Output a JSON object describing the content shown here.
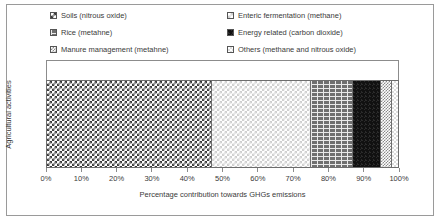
{
  "chart_data": {
    "type": "bar",
    "orientation": "horizontal",
    "stacked": true,
    "title": "",
    "xlabel": "Percentage contribution towards GHGs emissions",
    "ylabel": "Agricultural activities",
    "categories": [
      "Agricultural activities"
    ],
    "xlim": [
      0,
      100
    ],
    "grid": false,
    "legend_position": "top",
    "x_tick_labels": [
      "0%",
      "10%",
      "20%",
      "30%",
      "40%",
      "50%",
      "60%",
      "70%",
      "80%",
      "90%",
      "100%"
    ],
    "x_tick_values": [
      0,
      10,
      20,
      30,
      40,
      50,
      60,
      70,
      80,
      90,
      100
    ],
    "series": [
      {
        "name": "Soils (nitrous oxide)",
        "values": [
          47
        ],
        "pattern": "checker-dark",
        "color": "#3c3c3c"
      },
      {
        "name": "Enteric fermentation (methane)",
        "values": [
          28
        ],
        "pattern": "dots-light",
        "color": "#cfcfcf"
      },
      {
        "name": "Rice (metahne)",
        "values": [
          12
        ],
        "pattern": "brick-mid",
        "color": "#6f6f6f"
      },
      {
        "name": "Energy related (carbon dioxide)",
        "values": [
          8
        ],
        "pattern": "solid-black",
        "color": "#111111"
      },
      {
        "name": "Manure management (metahne)",
        "values": [
          3
        ],
        "pattern": "dots-mid",
        "color": "#8a8a8a"
      },
      {
        "name": "Others (methane and nitrous oxide)",
        "values": [
          2
        ],
        "pattern": "dots-vlight",
        "color": "#dddddd"
      }
    ]
  },
  "legend": {
    "left_column": [
      {
        "label": "Soils (nitrous oxide)"
      },
      {
        "label": "Rice (metahne)"
      },
      {
        "label": "Manure management (metahne)"
      }
    ],
    "right_column": [
      {
        "label": "Enteric fermentation (methane)"
      },
      {
        "label": "Energy related (carbon dioxide)"
      },
      {
        "label": "Others (methane and nitrous oxide)"
      }
    ]
  },
  "axes": {
    "x_title": "Percentage contribution towards GHGs emissions",
    "y_title": "Agricultural activities",
    "x_labels": [
      "0%",
      "10%",
      "20%",
      "30%",
      "40%",
      "50%",
      "60%",
      "70%",
      "80%",
      "90%",
      "100%"
    ]
  }
}
